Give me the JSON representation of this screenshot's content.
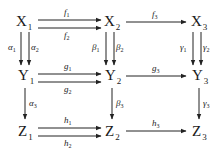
{
  "diagram": {
    "type": "commutative-diagram",
    "nodes": {
      "X1": {
        "base": "X",
        "sub": "1"
      },
      "X2": {
        "base": "X",
        "sub": "2"
      },
      "X3": {
        "base": "X",
        "sub": "3"
      },
      "Y1": {
        "base": "Y",
        "sub": "1"
      },
      "Y2": {
        "base": "Y",
        "sub": "2"
      },
      "Y3": {
        "base": "Y",
        "sub": "3"
      },
      "Z1": {
        "base": "Z",
        "sub": "1"
      },
      "Z2": {
        "base": "Z",
        "sub": "2"
      },
      "Z3": {
        "base": "Z",
        "sub": "3"
      }
    },
    "arrows": {
      "f1": {
        "base": "f",
        "sub": "1",
        "from": "X1",
        "to": "X2"
      },
      "f2": {
        "base": "f",
        "sub": "2",
        "from": "X1",
        "to": "X2"
      },
      "f3": {
        "base": "f",
        "sub": "3",
        "from": "X2",
        "to": "X3"
      },
      "g1": {
        "base": "g",
        "sub": "1",
        "from": "Y1",
        "to": "Y2"
      },
      "g2": {
        "base": "g",
        "sub": "2",
        "from": "Y1",
        "to": "Y2"
      },
      "g3": {
        "base": "g",
        "sub": "3",
        "from": "Y2",
        "to": "Y3"
      },
      "h1": {
        "base": "h",
        "sub": "1",
        "from": "Z1",
        "to": "Z2"
      },
      "h2": {
        "base": "h",
        "sub": "2",
        "from": "Z1",
        "to": "Z2"
      },
      "h3": {
        "base": "h",
        "sub": "3",
        "from": "Z2",
        "to": "Z3"
      },
      "a1": {
        "base": "α",
        "sub": "1",
        "from": "X1",
        "to": "Y1"
      },
      "a2": {
        "base": "α",
        "sub": "2",
        "from": "X1",
        "to": "Y1"
      },
      "a3": {
        "base": "α",
        "sub": "3",
        "from": "Y1",
        "to": "Z1"
      },
      "b1": {
        "base": "β",
        "sub": "1",
        "from": "X2",
        "to": "Y2"
      },
      "b2": {
        "base": "β",
        "sub": "2",
        "from": "X2",
        "to": "Y2"
      },
      "b3": {
        "base": "β",
        "sub": "3",
        "from": "Y2",
        "to": "Z2"
      },
      "c1": {
        "base": "γ",
        "sub": "1",
        "from": "X3",
        "to": "Y3"
      },
      "c2": {
        "base": "γ",
        "sub": "2",
        "from": "X3",
        "to": "Y3"
      },
      "c3": {
        "base": "γ",
        "sub": "3",
        "from": "Y3",
        "to": "Z3"
      }
    }
  }
}
